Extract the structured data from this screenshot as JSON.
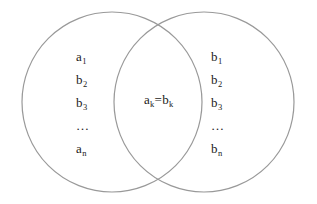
{
  "figure": {
    "type": "venn-diagram",
    "width": 317,
    "height": 204,
    "background_color": "#ffffff",
    "stroke_color": "#999999",
    "stroke_width": 1.2,
    "text_color": "#1a1a1a"
  },
  "left_set": {
    "name": "left-circle",
    "center_x": 112,
    "center_y": 102,
    "radius": 90,
    "items": [
      {
        "base": "a",
        "sub": "1"
      },
      {
        "base": "b",
        "sub": "2"
      },
      {
        "base": "b",
        "sub": "3"
      },
      {
        "base": "…",
        "sub": ""
      },
      {
        "base": "a",
        "sub": "n"
      }
    ]
  },
  "right_set": {
    "name": "right-circle",
    "center_x": 204,
    "center_y": 102,
    "radius": 90,
    "items": [
      {
        "base": "b",
        "sub": "1"
      },
      {
        "base": "b",
        "sub": "2"
      },
      {
        "base": "b",
        "sub": "3"
      },
      {
        "base": "…",
        "sub": ""
      },
      {
        "base": "b",
        "sub": "n"
      }
    ]
  },
  "intersection": {
    "left_base": "a",
    "left_sub": "k",
    "operator": "=",
    "right_base": "b",
    "right_sub": "k"
  }
}
